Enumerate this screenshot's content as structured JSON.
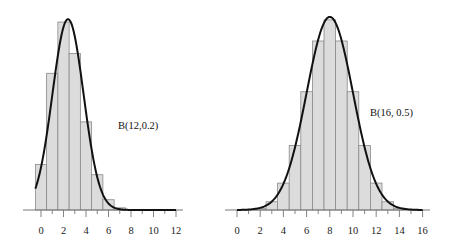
{
  "chart_data": [
    {
      "type": "bar",
      "title": "",
      "annotation": "B(12,0.2)",
      "distribution": {
        "n": 12,
        "p": 0.2
      },
      "xlabel": "",
      "ylabel": "",
      "xlim": [
        -1,
        12
      ],
      "xticks": [
        0,
        2,
        4,
        6,
        8,
        10,
        12
      ],
      "x_minor_ticks": [
        0,
        1,
        2,
        3,
        4,
        5,
        6,
        7,
        8,
        9,
        10,
        11,
        12
      ],
      "grid": false,
      "legend": null,
      "categories": [
        0,
        1,
        2,
        3,
        4,
        5,
        6,
        7,
        8,
        9,
        10,
        11,
        12
      ],
      "values": [
        0.0687,
        0.2062,
        0.2835,
        0.2362,
        0.1329,
        0.0532,
        0.0155,
        0.0033,
        0.0005,
        0.0001,
        0.0,
        0.0,
        0.0
      ],
      "overlay": {
        "type": "line",
        "name": "normal approximation",
        "mean": 2.4,
        "sd": 1.386,
        "x_start": -0.5,
        "x_end": 12
      }
    },
    {
      "type": "bar",
      "title": "",
      "annotation": "B(16, 0.5)",
      "distribution": {
        "n": 16,
        "p": 0.5
      },
      "xlabel": "",
      "ylabel": "",
      "xlim": [
        0,
        16
      ],
      "xticks": [
        0,
        2,
        4,
        6,
        8,
        10,
        12,
        14,
        16
      ],
      "x_minor_ticks": [
        0,
        1,
        2,
        3,
        4,
        5,
        6,
        7,
        8,
        9,
        10,
        11,
        12,
        13,
        14,
        15,
        16
      ],
      "grid": false,
      "legend": null,
      "categories": [
        0,
        1,
        2,
        3,
        4,
        5,
        6,
        7,
        8,
        9,
        10,
        11,
        12,
        13,
        14,
        15,
        16
      ],
      "values": [
        0.0,
        0.0002,
        0.0018,
        0.0085,
        0.0278,
        0.0667,
        0.1222,
        0.1746,
        0.1964,
        0.1746,
        0.1222,
        0.0667,
        0.0278,
        0.0085,
        0.0018,
        0.0002,
        0.0
      ],
      "overlay": {
        "type": "line",
        "name": "normal approximation",
        "mean": 8,
        "sd": 2,
        "x_start": 0,
        "x_end": 16
      }
    }
  ],
  "style": {
    "bar_fill": "#dcdcdc",
    "bar_stroke": "#8a8a8a",
    "curve_color": "#111111",
    "axis_color": "#777777"
  },
  "panels": [
    {
      "label": "B(12,0.2)",
      "tick_labels": [
        "0",
        "2",
        "4",
        "6",
        "8",
        "10",
        "12"
      ]
    },
    {
      "label": "B(16, 0.5)",
      "tick_labels": [
        "0",
        "2",
        "4",
        "6",
        "8",
        "10",
        "12",
        "14",
        "16"
      ]
    }
  ]
}
